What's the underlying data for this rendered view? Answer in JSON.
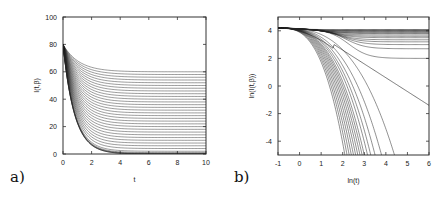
{
  "chart_data": [
    {
      "id": "a",
      "panel_label": "a)",
      "type": "line",
      "title": "",
      "xlabel": "t",
      "ylabel": "I(t,β)",
      "xlim": [
        0,
        10
      ],
      "ylim": [
        0,
        100
      ],
      "xticks": [
        0,
        2,
        4,
        6,
        8,
        10
      ],
      "yticks": [
        0,
        20,
        40,
        60,
        80,
        100
      ],
      "grid": false,
      "legend": "none",
      "series_description": "Family of ~30 curves starting at I=80 at t=0, decaying exponentially to plateaus evenly spaced from ~60 down to 0",
      "initial_value": 80,
      "plateaus": [
        60,
        58,
        56,
        54,
        52,
        50,
        48,
        46,
        44,
        42,
        40,
        38,
        36,
        34,
        32,
        30,
        28,
        26,
        24,
        22,
        20,
        18,
        16,
        14,
        12,
        10,
        8,
        6,
        4,
        2,
        1,
        0.5,
        0.2,
        0.05,
        0
      ],
      "frame": {
        "left": 63,
        "right": 206,
        "top": 17,
        "bottom": 154
      }
    },
    {
      "id": "b",
      "panel_label": "b)",
      "type": "line",
      "title": "",
      "xlabel": "ln(t)",
      "ylabel": "ln(I(t,β))",
      "xlim": [
        -1,
        6
      ],
      "ylim": [
        -5,
        5
      ],
      "xticks": [
        -1,
        0,
        1,
        2,
        3,
        4,
        5,
        6
      ],
      "yticks": [
        -4,
        -2,
        0,
        2,
        4
      ],
      "grid": false,
      "legend": "none",
      "series_description": "Log-log view of the same curves: curves with positive plateau level off (ln ~4.1 down to 2), one straight-line power-law curve falling to about -1.4 at ln(t)=6, and the rest drop steeply crossing -5 between ln(t)≈2.1 and 4.4",
      "start_point": {
        "x": -1,
        "y": 4.2
      },
      "flat_levels": [
        4.09,
        4.06,
        4.03,
        4.0,
        3.95,
        3.9,
        3.85,
        3.8,
        3.7,
        3.6,
        3.5,
        3.35,
        3.2,
        3.0,
        2.7,
        2.0
      ],
      "power_law_end": {
        "x": 6,
        "y": -1.4
      },
      "steep_crossings_at_minus5": [
        2.1,
        2.2,
        2.3,
        2.4,
        2.5,
        2.6,
        2.7,
        2.8,
        2.9,
        3.0,
        3.15,
        3.3,
        3.5,
        3.8,
        4.4
      ],
      "frame": {
        "left": 278,
        "right": 429,
        "top": 17,
        "bottom": 155
      }
    }
  ]
}
